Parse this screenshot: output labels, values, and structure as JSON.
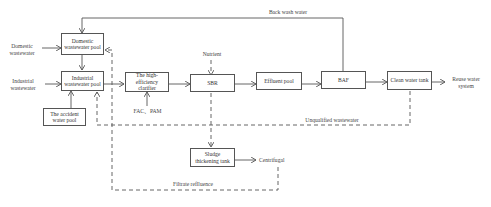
{
  "diagram": {
    "type": "process-flow",
    "title": "",
    "nodes": {
      "domestic_pool": "Domestic wastewater pool",
      "industrial_pool": "Industrial wastewater pool",
      "accident_pool": "The accident water pool",
      "clarifier": "The high-efficiency clarifier",
      "sbr": "SBR",
      "effluent_pool": "Effluent pool",
      "baf": "BAF",
      "clean_tank": "Clean water tank",
      "sludge_tank": "Sludge thickening tank"
    },
    "labels": {
      "domestic_in": "Domestic wastewater",
      "industrial_in": "Industrial wastewater",
      "nutrient": "Nutrient",
      "fac_pam": "FAC、PAM",
      "reuse": "Reuse water system",
      "back_wash": "Back wash water",
      "unqualified": "Unqualified wastewater",
      "centrifugal": "Centrifugal",
      "filtrate": "Filtrate reflluence"
    },
    "edges": [
      {
        "from": "Domestic wastewater",
        "to": "domestic_pool",
        "style": "solid"
      },
      {
        "from": "domestic_pool",
        "to": "industrial_pool",
        "style": "solid"
      },
      {
        "from": "Industrial wastewater",
        "to": "industrial_pool",
        "style": "solid"
      },
      {
        "from": "accident_pool",
        "to": "industrial_pool",
        "style": "solid"
      },
      {
        "from": "industrial_pool",
        "to": "clarifier",
        "style": "solid"
      },
      {
        "from": "FAC、PAM",
        "to": "clarifier",
        "style": "solid"
      },
      {
        "from": "clarifier",
        "to": "sbr",
        "style": "solid"
      },
      {
        "from": "Nutrient",
        "to": "sbr",
        "style": "dashed"
      },
      {
        "from": "sbr",
        "to": "effluent_pool",
        "style": "solid"
      },
      {
        "from": "effluent_pool",
        "to": "baf",
        "style": "solid"
      },
      {
        "from": "baf",
        "to": "clean_tank",
        "style": "solid"
      },
      {
        "from": "clean_tank",
        "to": "Reuse water system",
        "style": "solid"
      },
      {
        "from": "baf",
        "to": "domestic_pool",
        "label": "Back wash water",
        "style": "solid"
      },
      {
        "from": "clean_tank",
        "to": "industrial_pool",
        "label": "Unqualified wastewater",
        "style": "dashed"
      },
      {
        "from": "sbr",
        "to": "sludge_tank",
        "style": "dashed"
      },
      {
        "from": "sludge_tank",
        "to": "Centrifugal",
        "style": "solid"
      },
      {
        "from": "Centrifugal",
        "to": "domestic_pool",
        "label": "Filtrate reflluence",
        "style": "dashed"
      }
    ]
  }
}
